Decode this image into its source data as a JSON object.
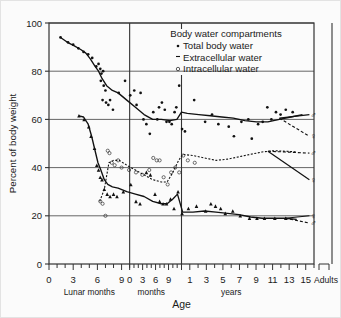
{
  "chart_data": {
    "type": "line",
    "title": "",
    "xlabel": "Age",
    "ylabel": "Percent of body weight",
    "ylim": [
      0,
      100
    ],
    "yticks": [
      0,
      20,
      40,
      60,
      80,
      100
    ],
    "grid": true,
    "legend": {
      "position": "top-right-inside",
      "title": "Body water compartments",
      "entries": [
        {
          "label": "Total body water",
          "marker": "filled-dot"
        },
        {
          "label": "Extracellular water",
          "marker": "dash-tick"
        },
        {
          "label": "Intracellular water",
          "marker": "open-circle"
        }
      ]
    },
    "x_axis": {
      "segments": [
        {
          "name": "Lunar months",
          "ticks": [
            "0",
            "3",
            "6",
            "9"
          ]
        },
        {
          "name": "months",
          "ticks": [
            "0",
            "3",
            "6",
            "9"
          ]
        },
        {
          "name": "years",
          "ticks": [
            "1",
            "3",
            "5",
            "7",
            "9",
            "11",
            "13",
            "15"
          ]
        }
      ],
      "adults_label": "Adults"
    },
    "adult_markers": [
      {
        "series": "Total body water",
        "sex": "male",
        "symbol": "♂",
        "value": 62
      },
      {
        "series": "Total body water",
        "sex": "female",
        "symbol": "♀",
        "value": 53
      },
      {
        "series": "Intracellular water",
        "sex": "male",
        "symbol": "♂",
        "value": 46
      },
      {
        "series": "Intracellular water",
        "sex": "female",
        "symbol": "♀",
        "value": 35
      },
      {
        "series": "Extracellular water",
        "sex": "female",
        "symbol": "♀",
        "value": 20
      },
      {
        "series": "Extracellular water",
        "sex": "male",
        "symbol": "♂",
        "value": 17
      }
    ],
    "series": [
      {
        "name": "Total body water",
        "marker": "filled-dot",
        "line": "solid",
        "points": [
          {
            "x": 2,
            "y": 94
          },
          {
            "x": 3.2,
            "y": 92
          },
          {
            "x": 4.4,
            "y": 90.5
          },
          {
            "x": 5.5,
            "y": 89
          },
          {
            "x": 6.4,
            "y": 87.5
          },
          {
            "x": 7.2,
            "y": 85
          },
          {
            "x": 8.0,
            "y": 82
          },
          {
            "x": 8.6,
            "y": 80
          },
          {
            "x": 9.2,
            "y": 77
          },
          {
            "x": 10.0,
            "y": 74
          },
          {
            "x": 11.0,
            "y": 72
          },
          {
            "x": 12.0,
            "y": 71
          },
          {
            "x": 13.5,
            "y": 68
          },
          {
            "x": 15.0,
            "y": 65
          },
          {
            "x": 16.5,
            "y": 62
          },
          {
            "x": 18.0,
            "y": 60
          },
          {
            "x": 19.5,
            "y": 60
          },
          {
            "x": 21.0,
            "y": 59.5
          },
          {
            "x": 22.2,
            "y": 60
          },
          {
            "x": 23.0,
            "y": 63
          },
          {
            "x": 24.0,
            "y": 62.5
          },
          {
            "x": 26.0,
            "y": 62
          },
          {
            "x": 28.0,
            "y": 61.5
          },
          {
            "x": 30.0,
            "y": 61
          },
          {
            "x": 32.0,
            "y": 60.5
          },
          {
            "x": 34.0,
            "y": 59.5
          },
          {
            "x": 36.0,
            "y": 59
          },
          {
            "x": 38.0,
            "y": 59
          },
          {
            "x": 40.0,
            "y": 60
          },
          {
            "x": 42.0,
            "y": 61
          },
          {
            "x": 44.0,
            "y": 62
          }
        ]
      },
      {
        "name": "Intracellular water",
        "marker": "open-circle",
        "line": "dotted",
        "points": [
          {
            "x": 8.8,
            "y": 26
          },
          {
            "x": 9.6,
            "y": 31
          },
          {
            "x": 10.4,
            "y": 42
          },
          {
            "x": 11.2,
            "y": 43
          },
          {
            "x": 12.2,
            "y": 43
          },
          {
            "x": 13.5,
            "y": 41
          },
          {
            "x": 15.0,
            "y": 39
          },
          {
            "x": 16.5,
            "y": 37
          },
          {
            "x": 18.0,
            "y": 35
          },
          {
            "x": 19.5,
            "y": 34
          },
          {
            "x": 20.5,
            "y": 34
          },
          {
            "x": 21.5,
            "y": 38
          },
          {
            "x": 22.5,
            "y": 43
          },
          {
            "x": 23.2,
            "y": 45.5
          },
          {
            "x": 25.0,
            "y": 45
          },
          {
            "x": 27.0,
            "y": 44
          },
          {
            "x": 29.0,
            "y": 43
          },
          {
            "x": 31.0,
            "y": 43.5
          },
          {
            "x": 33.0,
            "y": 44.5
          },
          {
            "x": 35.0,
            "y": 45.5
          },
          {
            "x": 37.0,
            "y": 46.5
          },
          {
            "x": 39.0,
            "y": 47
          },
          {
            "x": 41.0,
            "y": 46.8
          },
          {
            "x": 43.0,
            "y": 46.5
          }
        ]
      },
      {
        "name": "Extracellular water",
        "marker": "filled-triangle",
        "line": "solid",
        "points": [
          {
            "x": 5.2,
            "y": 61.5
          },
          {
            "x": 6.0,
            "y": 61
          },
          {
            "x": 6.8,
            "y": 58
          },
          {
            "x": 7.4,
            "y": 53
          },
          {
            "x": 8.0,
            "y": 47
          },
          {
            "x": 8.5,
            "y": 42
          },
          {
            "x": 9.0,
            "y": 39
          },
          {
            "x": 9.6,
            "y": 35
          },
          {
            "x": 10.2,
            "y": 33
          },
          {
            "x": 11.0,
            "y": 32
          },
          {
            "x": 12.0,
            "y": 31.5
          },
          {
            "x": 13.5,
            "y": 30
          },
          {
            "x": 15.0,
            "y": 29
          },
          {
            "x": 16.5,
            "y": 28
          },
          {
            "x": 18.0,
            "y": 26
          },
          {
            "x": 19.5,
            "y": 25
          },
          {
            "x": 20.5,
            "y": 25
          },
          {
            "x": 21.5,
            "y": 27
          },
          {
            "x": 22.3,
            "y": 29
          },
          {
            "x": 23.2,
            "y": 21.5
          },
          {
            "x": 25.0,
            "y": 21.5
          },
          {
            "x": 27.0,
            "y": 22
          },
          {
            "x": 29.0,
            "y": 21.5
          },
          {
            "x": 31.0,
            "y": 21
          },
          {
            "x": 33.0,
            "y": 20.5
          },
          {
            "x": 35.0,
            "y": 19.5
          },
          {
            "x": 37.0,
            "y": 19
          },
          {
            "x": 39.0,
            "y": 19
          },
          {
            "x": 41.0,
            "y": 19
          },
          {
            "x": 43.0,
            "y": 18.5
          }
        ]
      }
    ],
    "scatter": {
      "total_body_water": [
        {
          "x": 2,
          "y": 94
        },
        {
          "x": 3.3,
          "y": 92
        },
        {
          "x": 4.2,
          "y": 91
        },
        {
          "x": 5.1,
          "y": 89.5
        },
        {
          "x": 6.0,
          "y": 88
        },
        {
          "x": 6.8,
          "y": 87
        },
        {
          "x": 7.5,
          "y": 85.5
        },
        {
          "x": 8.2,
          "y": 82
        },
        {
          "x": 8.6,
          "y": 83
        },
        {
          "x": 8.9,
          "y": 81
        },
        {
          "x": 9.1,
          "y": 79
        },
        {
          "x": 9.4,
          "y": 80
        },
        {
          "x": 9.0,
          "y": 76
        },
        {
          "x": 9.5,
          "y": 74
        },
        {
          "x": 9.8,
          "y": 72
        },
        {
          "x": 9.3,
          "y": 68
        },
        {
          "x": 9.9,
          "y": 67
        },
        {
          "x": 10.3,
          "y": 66
        },
        {
          "x": 10.6,
          "y": 68
        },
        {
          "x": 11.1,
          "y": 64
        },
        {
          "x": 12.1,
          "y": 71
        },
        {
          "x": 13.2,
          "y": 76
        },
        {
          "x": 14.1,
          "y": 70
        },
        {
          "x": 14.8,
          "y": 72
        },
        {
          "x": 15.2,
          "y": 66
        },
        {
          "x": 15.9,
          "y": 71
        },
        {
          "x": 16.4,
          "y": 60
        },
        {
          "x": 16.9,
          "y": 58
        },
        {
          "x": 17.5,
          "y": 54
        },
        {
          "x": 18.1,
          "y": 63
        },
        {
          "x": 18.8,
          "y": 60
        },
        {
          "x": 19.1,
          "y": 65
        },
        {
          "x": 19.6,
          "y": 67
        },
        {
          "x": 20.1,
          "y": 64
        },
        {
          "x": 20.4,
          "y": 59
        },
        {
          "x": 20.9,
          "y": 59
        },
        {
          "x": 21.3,
          "y": 58
        },
        {
          "x": 21.8,
          "y": 63
        },
        {
          "x": 22.1,
          "y": 65
        },
        {
          "x": 22.6,
          "y": 74
        },
        {
          "x": 23.1,
          "y": 56
        },
        {
          "x": 23.6,
          "y": 55
        },
        {
          "x": 25.2,
          "y": 68
        },
        {
          "x": 27.1,
          "y": 59
        },
        {
          "x": 28.3,
          "y": 62
        },
        {
          "x": 29.4,
          "y": 58
        },
        {
          "x": 31.2,
          "y": 57
        },
        {
          "x": 32.1,
          "y": 53
        },
        {
          "x": 33.4,
          "y": 59
        },
        {
          "x": 34.6,
          "y": 60
        },
        {
          "x": 35.2,
          "y": 52
        },
        {
          "x": 36.3,
          "y": 58
        },
        {
          "x": 37.1,
          "y": 59
        },
        {
          "x": 37.9,
          "y": 65
        },
        {
          "x": 38.6,
          "y": 60
        },
        {
          "x": 39.4,
          "y": 63
        },
        {
          "x": 40.2,
          "y": 62
        },
        {
          "x": 41.1,
          "y": 64
        },
        {
          "x": 42.3,
          "y": 63
        }
      ],
      "intracellular_water": [
        {
          "x": 8.9,
          "y": 26
        },
        {
          "x": 9.3,
          "y": 25
        },
        {
          "x": 9.8,
          "y": 20
        },
        {
          "x": 10.2,
          "y": 47
        },
        {
          "x": 10.5,
          "y": 46
        },
        {
          "x": 10.9,
          "y": 42
        },
        {
          "x": 11.4,
          "y": 41
        },
        {
          "x": 12.0,
          "y": 43
        },
        {
          "x": 12.6,
          "y": 40
        },
        {
          "x": 13.9,
          "y": 39
        },
        {
          "x": 15.1,
          "y": 38
        },
        {
          "x": 16.2,
          "y": 37
        },
        {
          "x": 17.4,
          "y": 39
        },
        {
          "x": 18.1,
          "y": 44
        },
        {
          "x": 18.7,
          "y": 43
        },
        {
          "x": 19.2,
          "y": 43
        },
        {
          "x": 19.9,
          "y": 36
        },
        {
          "x": 20.6,
          "y": 33
        },
        {
          "x": 21.2,
          "y": 38
        },
        {
          "x": 21.9,
          "y": 40
        },
        {
          "x": 22.6,
          "y": 38
        },
        {
          "x": 23.3,
          "y": 45
        },
        {
          "x": 24.1,
          "y": 43
        },
        {
          "x": 25.3,
          "y": 42
        }
      ],
      "extracellular_water": [
        {
          "x": 5.2,
          "y": 61.5
        },
        {
          "x": 6.1,
          "y": 60
        },
        {
          "x": 6.9,
          "y": 57
        },
        {
          "x": 7.3,
          "y": 53
        },
        {
          "x": 7.9,
          "y": 48
        },
        {
          "x": 8.3,
          "y": 41
        },
        {
          "x": 8.6,
          "y": 39
        },
        {
          "x": 8.9,
          "y": 36
        },
        {
          "x": 9.2,
          "y": 35
        },
        {
          "x": 9.6,
          "y": 31
        },
        {
          "x": 10.1,
          "y": 29
        },
        {
          "x": 10.6,
          "y": 28
        },
        {
          "x": 11.2,
          "y": 29
        },
        {
          "x": 11.8,
          "y": 28
        },
        {
          "x": 12.9,
          "y": 30
        },
        {
          "x": 14.2,
          "y": 33
        },
        {
          "x": 15.1,
          "y": 26
        },
        {
          "x": 15.8,
          "y": 25
        },
        {
          "x": 16.9,
          "y": 38
        },
        {
          "x": 17.6,
          "y": 37
        },
        {
          "x": 18.4,
          "y": 29
        },
        {
          "x": 19.2,
          "y": 26
        },
        {
          "x": 19.8,
          "y": 25
        },
        {
          "x": 20.4,
          "y": 25
        },
        {
          "x": 21.1,
          "y": 27
        },
        {
          "x": 21.7,
          "y": 23
        },
        {
          "x": 22.4,
          "y": 30
        },
        {
          "x": 23.1,
          "y": 21
        },
        {
          "x": 24.2,
          "y": 23
        },
        {
          "x": 25.6,
          "y": 24
        },
        {
          "x": 27.2,
          "y": 22
        },
        {
          "x": 28.1,
          "y": 25
        },
        {
          "x": 28.9,
          "y": 24
        },
        {
          "x": 29.8,
          "y": 23
        },
        {
          "x": 30.6,
          "y": 21
        },
        {
          "x": 31.9,
          "y": 22
        },
        {
          "x": 33.2,
          "y": 20
        },
        {
          "x": 34.8,
          "y": 19
        },
        {
          "x": 36.1,
          "y": 19
        },
        {
          "x": 37.4,
          "y": 19
        },
        {
          "x": 39.2,
          "y": 19
        },
        {
          "x": 41.1,
          "y": 19
        }
      ]
    }
  }
}
